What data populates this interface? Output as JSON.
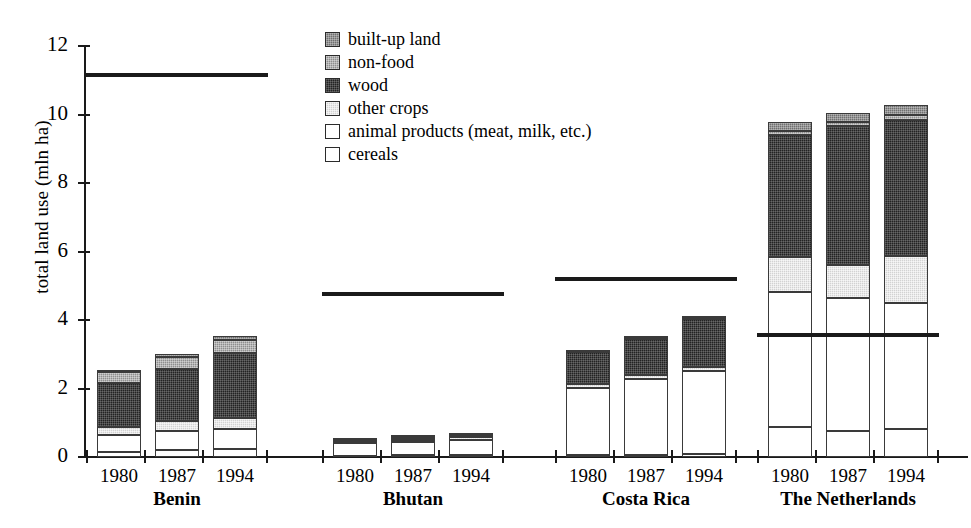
{
  "chart_data": {
    "type": "bar",
    "subtype": "stacked-bar-grouped",
    "title": "",
    "xlabel": "",
    "ylabel": "total land use (mln ha)",
    "ylim": [
      0,
      12
    ],
    "ytick_values": [
      0,
      2,
      4,
      6,
      8,
      10,
      12
    ],
    "ytick_labels": [
      "0",
      "2",
      "4",
      "6",
      "8",
      "10",
      "12"
    ],
    "grid": false,
    "legend_position": "top-center",
    "stack_order_bottom_to_top": [
      "cereals",
      "animal products (meat, milk, etc.)",
      "other crops",
      "wood",
      "non-food",
      "built-up land"
    ],
    "series": [
      {
        "name": "cereals",
        "key": "cereals",
        "swatch": "white-open",
        "values": [
          0.16,
          0.19,
          0.22,
          0.04,
          0.05,
          0.06,
          0.06,
          0.07,
          0.08,
          0.88,
          0.76,
          0.82
        ]
      },
      {
        "name": "animal products (meat, milk, etc.)",
        "key": "animal",
        "swatch": "white-open",
        "values": [
          0.49,
          0.56,
          0.59,
          0.37,
          0.4,
          0.44,
          1.95,
          2.2,
          2.42,
          3.95,
          3.87,
          3.68
        ]
      },
      {
        "name": "other crops",
        "key": "othercrops",
        "swatch": "light-grey-stipple",
        "values": [
          0.24,
          0.3,
          0.34,
          0.05,
          0.06,
          0.07,
          0.12,
          0.12,
          0.14,
          1.0,
          0.97,
          1.38
        ]
      },
      {
        "name": "wood",
        "key": "wood",
        "swatch": "near-black",
        "values": [
          1.28,
          1.52,
          1.9,
          0.03,
          0.04,
          0.04,
          0.93,
          1.05,
          1.38,
          3.58,
          4.05,
          3.96
        ]
      },
      {
        "name": "non-food",
        "key": "nonfood",
        "swatch": "medium-grey",
        "values": [
          0.3,
          0.34,
          0.37,
          0.02,
          0.02,
          0.02,
          0.02,
          0.02,
          0.03,
          0.12,
          0.13,
          0.14
        ]
      },
      {
        "name": "built-up land",
        "key": "builtup",
        "swatch": "dark-grey",
        "values": [
          0.08,
          0.09,
          0.1,
          0.02,
          0.02,
          0.03,
          0.02,
          0.02,
          0.03,
          0.25,
          0.26,
          0.31
        ]
      }
    ],
    "groups": [
      {
        "label": "Benin",
        "reference_line_value": 11.15,
        "bars": [
          {
            "year": "1980",
            "total": 2.61,
            "cereals": 0.16,
            "animal": 0.49,
            "othercrops": 0.24,
            "wood": 1.28,
            "nonfood": 0.3,
            "builtup": 0.08
          },
          {
            "year": "1987",
            "total": 3.09,
            "cereals": 0.19,
            "animal": 0.56,
            "othercrops": 0.3,
            "wood": 1.52,
            "nonfood": 0.34,
            "builtup": 0.09
          },
          {
            "year": "1994",
            "total": 3.62,
            "cereals": 0.22,
            "animal": 0.59,
            "othercrops": 0.34,
            "wood": 1.9,
            "nonfood": 0.37,
            "builtup": 0.1
          }
        ]
      },
      {
        "label": "Bhutan",
        "reference_line_value": 4.77,
        "bars": [
          {
            "year": "1980",
            "total": 0.53,
            "cereals": 0.04,
            "animal": 0.37,
            "othercrops": 0.05,
            "wood": 0.03,
            "nonfood": 0.02,
            "builtup": 0.02
          },
          {
            "year": "1987",
            "total": 0.59,
            "cereals": 0.05,
            "animal": 0.4,
            "othercrops": 0.06,
            "wood": 0.04,
            "nonfood": 0.02,
            "builtup": 0.02
          },
          {
            "year": "1994",
            "total": 0.66,
            "cereals": 0.06,
            "animal": 0.44,
            "othercrops": 0.07,
            "wood": 0.04,
            "nonfood": 0.02,
            "builtup": 0.03
          }
        ]
      },
      {
        "label": "Costa Rica",
        "reference_line_value": 5.2,
        "bars": [
          {
            "year": "1980",
            "total": 3.1,
            "cereals": 0.06,
            "animal": 1.95,
            "othercrops": 0.12,
            "wood": 0.93,
            "nonfood": 0.02,
            "builtup": 0.02
          },
          {
            "year": "1987",
            "total": 3.48,
            "cereals": 0.07,
            "animal": 2.2,
            "othercrops": 0.12,
            "wood": 1.05,
            "nonfood": 0.02,
            "builtup": 0.02
          },
          {
            "year": "1994",
            "total": 4.08,
            "cereals": 0.08,
            "animal": 2.42,
            "othercrops": 0.14,
            "wood": 1.38,
            "nonfood": 0.03,
            "builtup": 0.03
          }
        ]
      },
      {
        "label": "The Netherlands",
        "reference_line_value": 3.55,
        "bars": [
          {
            "year": "1980",
            "total": 9.78,
            "cereals": 0.88,
            "animal": 3.95,
            "othercrops": 1.0,
            "wood": 3.58,
            "nonfood": 0.12,
            "builtup": 0.25
          },
          {
            "year": "1987",
            "total": 10.04,
            "cereals": 0.76,
            "animal": 3.87,
            "othercrops": 0.97,
            "wood": 4.05,
            "nonfood": 0.13,
            "builtup": 0.26
          },
          {
            "year": "1994",
            "total": 10.29,
            "cereals": 0.82,
            "animal": 3.68,
            "othercrops": 1.38,
            "wood": 3.96,
            "nonfood": 0.14,
            "builtup": 0.31
          }
        ]
      }
    ]
  },
  "legend": {
    "items": [
      {
        "label": "built-up land",
        "key": "builtup"
      },
      {
        "label": "non-food",
        "key": "nonfood"
      },
      {
        "label": "wood",
        "key": "wood"
      },
      {
        "label": "other crops",
        "key": "othercrops"
      },
      {
        "label": "animal products (meat, milk, etc.)",
        "key": "animal"
      },
      {
        "label": "cereals",
        "key": "cereals"
      }
    ]
  },
  "colors": {
    "builtup": "#6f6f6f",
    "nonfood": "#8e8e8e",
    "wood": "#232323",
    "othercrops": "#d2d2d2",
    "animal": "#ffffff",
    "cereals": "#ffffff",
    "axis": "#1a1a1a",
    "reference_line": "#1a1a1a",
    "background": "#ffffff"
  }
}
